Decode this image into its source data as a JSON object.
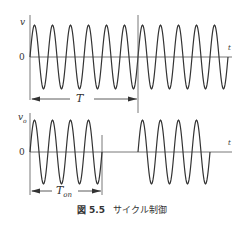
{
  "figure": {
    "caption_number": "図 5.5",
    "caption_text": "サイクル制御"
  },
  "top_plot": {
    "y_label": "v",
    "x_label": "t",
    "zero_label": "0",
    "period_label": "T"
  },
  "bottom_plot": {
    "y_label": "v",
    "y_label_sub": "o",
    "x_label": "t",
    "zero_label": "0",
    "on_label": "T",
    "on_label_sub": "on"
  },
  "colors": {
    "line": "#333333",
    "axis": "#555555"
  }
}
